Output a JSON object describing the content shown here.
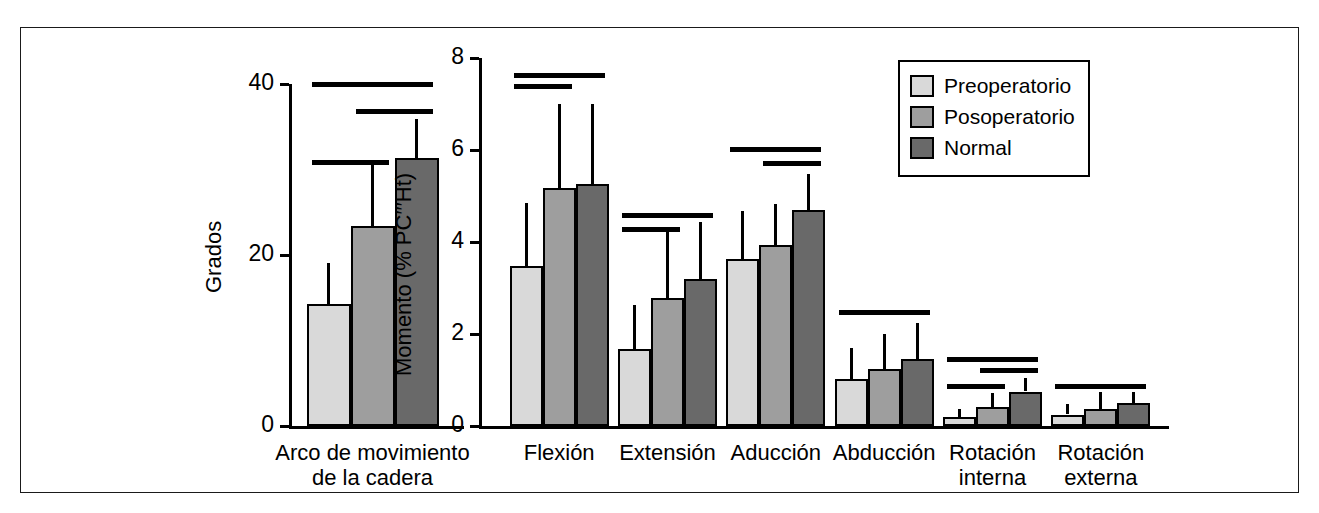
{
  "figure": {
    "border_color": "#1a1a1a",
    "background": "#ffffff"
  },
  "legend": {
    "position": "top-right",
    "entries": [
      {
        "label": "Preoperatorio",
        "color": "#d9d9d9"
      },
      {
        "label": "Posoperatorio",
        "color": "#9e9e9e"
      },
      {
        "label": "Normal",
        "color": "#696969"
      }
    ]
  },
  "chart_data": [
    {
      "id": "rom-panel",
      "type": "bar",
      "title": "",
      "xlabel": "",
      "ylabel": "Grados",
      "ylim": [
        0,
        40
      ],
      "yticks": [
        0,
        20,
        40
      ],
      "ytick_labels": [
        "0",
        "20",
        "40"
      ],
      "grid": false,
      "categories": [
        "Arco de movimiento\nde la cadera"
      ],
      "series": [
        {
          "name": "Preoperatorio",
          "color": "#d9d9d9",
          "values": [
            14.3
          ],
          "errors": [
            4.8
          ]
        },
        {
          "name": "Posoperatorio",
          "color": "#9e9e9e",
          "values": [
            23.4
          ],
          "errors": [
            7.2
          ]
        },
        {
          "name": "Normal",
          "color": "#696969",
          "values": [
            31.3
          ],
          "errors": [
            4.6
          ]
        }
      ],
      "significance_bars": [
        {
          "group": "Arco de movimiento de la cadera",
          "between": [
            1,
            3
          ],
          "y": 40.0
        },
        {
          "group": "Arco de movimiento de la cadera",
          "between": [
            2,
            3
          ],
          "y": 36.8
        },
        {
          "group": "Arco de movimiento de la cadera",
          "between": [
            1,
            2
          ],
          "y": 30.9
        }
      ]
    },
    {
      "id": "moment-panel",
      "type": "bar",
      "title": "",
      "xlabel": "",
      "ylabel": "Momento (% PC′′′Ht)",
      "ylim": [
        0,
        8
      ],
      "yticks": [
        0,
        2,
        4,
        6,
        8
      ],
      "ytick_labels": [
        "0",
        "2",
        "4",
        "6",
        "8"
      ],
      "grid": false,
      "categories": [
        "Flexión",
        "Extensión",
        "Aducción",
        "Abducción",
        "Rotación\ninterna",
        "Rotación\nexterna"
      ],
      "series": [
        {
          "name": "Preoperatorio",
          "color": "#d9d9d9",
          "values": [
            3.48,
            1.68,
            3.62,
            1.02,
            0.2,
            0.25
          ],
          "errors": [
            1.37,
            0.95,
            1.05,
            0.68,
            0.18,
            0.23
          ]
        },
        {
          "name": "Posoperatorio",
          "color": "#9e9e9e",
          "values": [
            5.17,
            2.78,
            3.93,
            1.25,
            0.41,
            0.38
          ],
          "errors": [
            1.83,
            1.45,
            0.9,
            0.75,
            0.3,
            0.35
          ]
        },
        {
          "name": "Normal",
          "color": "#696969",
          "values": [
            5.27,
            3.2,
            4.7,
            1.45,
            0.75,
            0.5
          ],
          "errors": [
            1.73,
            1.23,
            0.78,
            0.8,
            0.3,
            0.25
          ]
        }
      ],
      "significance_bars": [
        {
          "group": "Flexión",
          "between": [
            1,
            3
          ],
          "y": 7.62
        },
        {
          "group": "Flexión",
          "between": [
            1,
            2
          ],
          "y": 7.4
        },
        {
          "group": "Extensión",
          "between": [
            1,
            3
          ],
          "y": 4.58
        },
        {
          "group": "Extensión",
          "between": [
            1,
            2
          ],
          "y": 4.28
        },
        {
          "group": "Aducción",
          "between": [
            1,
            3
          ],
          "y": 6.02
        },
        {
          "group": "Aducción",
          "between": [
            2,
            3
          ],
          "y": 5.72
        },
        {
          "group": "Abducción",
          "between": [
            1,
            3
          ],
          "y": 2.48
        },
        {
          "group": "Rotación interna",
          "between": [
            1,
            3
          ],
          "y": 1.45
        },
        {
          "group": "Rotación interna",
          "between": [
            2,
            3
          ],
          "y": 1.22
        },
        {
          "group": "Rotación interna",
          "between": [
            1,
            2
          ],
          "y": 0.88
        },
        {
          "group": "Rotación externa",
          "between": [
            1,
            3
          ],
          "y": 0.88
        }
      ]
    }
  ]
}
